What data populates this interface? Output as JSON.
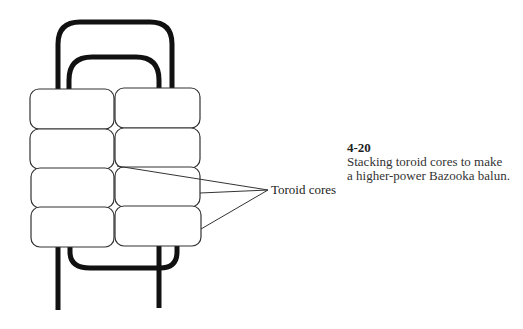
{
  "figure": {
    "number": "4-20",
    "caption_lines": [
      "Stacking toroid cores to make",
      "a higher-power Bazooka balun."
    ]
  },
  "diagram": {
    "callout_label": "Toroid cores",
    "core_rows": 4,
    "core_columns": 2
  }
}
